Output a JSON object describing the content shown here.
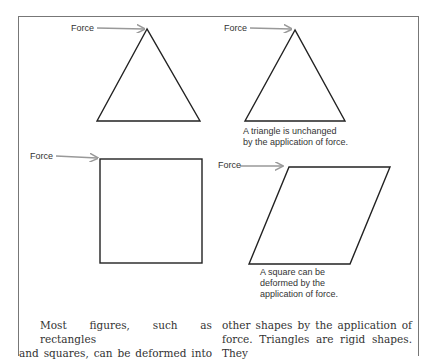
{
  "figure": {
    "panels": [
      {
        "id": "triangle-before",
        "force_label": "Force",
        "caption": ""
      },
      {
        "id": "triangle-after",
        "force_label": "Force",
        "caption_lines": [
          "A triangle is unchanged",
          "by the application of force."
        ]
      },
      {
        "id": "square-before",
        "force_label": "Force",
        "caption": ""
      },
      {
        "id": "square-after",
        "force_label": "Force",
        "caption_lines": [
          "A square can be",
          "deformed by the",
          "application of force."
        ]
      }
    ],
    "colors": {
      "arrow": "#999999",
      "stroke": "#222222",
      "frame": "#777777"
    }
  },
  "body_text": {
    "left_column": [
      "Most figures, such as rectangles",
      "and squares, can be deformed into"
    ],
    "right_column": [
      "other shapes by the application of",
      "force. Triangles are rigid shapes. They"
    ]
  }
}
